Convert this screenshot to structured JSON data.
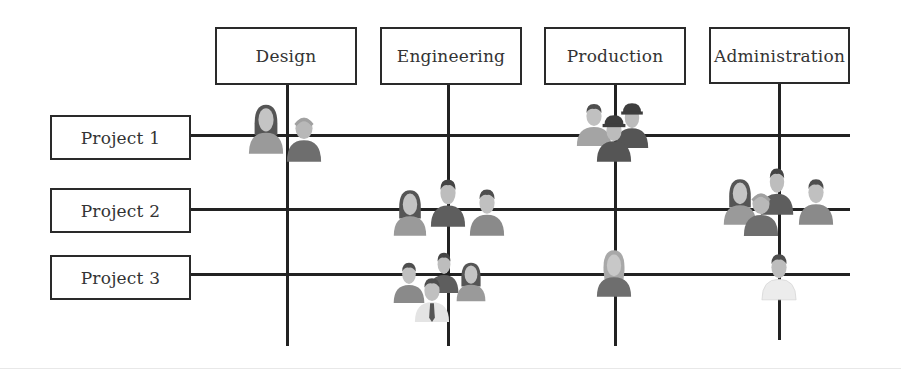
{
  "diagram": {
    "type": "matrix-organization",
    "departments": [
      {
        "label": "Design",
        "x": 287
      },
      {
        "label": "Engineering",
        "x": 448
      },
      {
        "label": "Production",
        "x": 615
      },
      {
        "label": "Administration",
        "x": 779
      }
    ],
    "projects": [
      {
        "label": "Project 1",
        "y": 135
      },
      {
        "label": "Project 2",
        "y": 209
      },
      {
        "label": "Project 3",
        "y": 275
      }
    ],
    "staffing": [
      {
        "project": "Project 1",
        "department": "Design",
        "people": 2
      },
      {
        "project": "Project 1",
        "department": "Production",
        "people": 3
      },
      {
        "project": "Project 2",
        "department": "Engineering",
        "people": 3
      },
      {
        "project": "Project 2",
        "department": "Administration",
        "people": 4
      },
      {
        "project": "Project 3",
        "department": "Engineering",
        "people": 4
      },
      {
        "project": "Project 3",
        "department": "Production",
        "people": 1
      },
      {
        "project": "Project 3",
        "department": "Administration",
        "people": 1
      }
    ],
    "colors": {
      "line": "#222222",
      "box_border": "#2a2a2a",
      "text": "#333333",
      "person_light": "#b0b0b0",
      "person_mid": "#8e8e8e",
      "person_dark": "#6a6a6a",
      "skin": "#c9c9c9",
      "hair": "#5a5a5a",
      "shirt_white": "#e6e6e6"
    }
  }
}
